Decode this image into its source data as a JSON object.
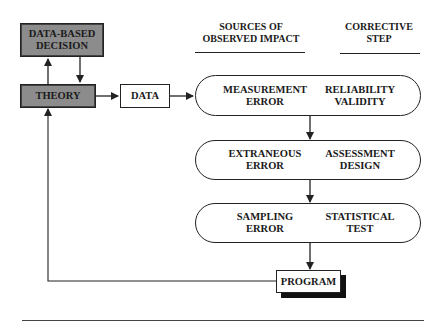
{
  "diagram": {
    "nodes": {
      "decision": "DATA-BASED DECISION",
      "theory": "THEORY",
      "data": "DATA",
      "program": "PROGRAM"
    },
    "headers": {
      "sources": "SOURCES OF OBSERVED IMPACT",
      "corrective": "CORRECTIVE STEP"
    },
    "rows": [
      {
        "source_1": "MEASUREMENT",
        "source_2": "ERROR",
        "step_1": "RELIABILITY",
        "step_2": "VALIDITY"
      },
      {
        "source_1": "EXTRANEOUS",
        "source_2": "ERROR",
        "step_1": "ASSESSMENT",
        "step_2": "DESIGN"
      },
      {
        "source_1": "SAMPLING",
        "source_2": "ERROR",
        "step_1": "STATISTICAL",
        "step_2": "TEST"
      }
    ],
    "colors": {
      "gray_box": "#8c8c8c",
      "line": "#222222"
    }
  }
}
